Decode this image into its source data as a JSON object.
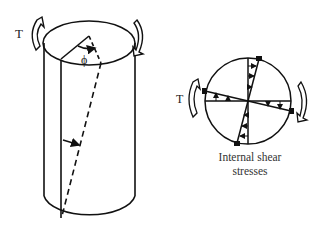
{
  "diagram": {
    "type": "torsion-of-circular-shaft",
    "cylinder": {
      "torque_label": "T",
      "angle_label": "ϕ"
    },
    "cross_section": {
      "torque_label": "T",
      "caption_line1": "Internal shear",
      "caption_line2": "stresses"
    },
    "colors": {
      "stroke": "#111111",
      "background": "#ffffff",
      "text": "#222222"
    }
  }
}
